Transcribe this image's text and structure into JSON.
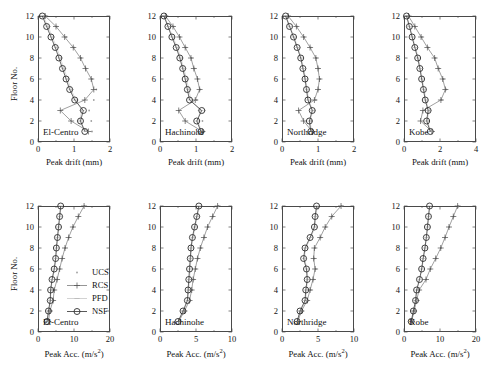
{
  "figure": {
    "ylabel": "Floor No.",
    "series_names": [
      "UCS",
      "RCS",
      "PFD",
      "NSF"
    ],
    "legend": [
      {
        "label": "UCS",
        "marker": "dot-small",
        "color": "#9a9a9a"
      },
      {
        "label": "RCS",
        "marker": "plus",
        "color": "#555555"
      },
      {
        "label": "PFD",
        "marker": "dash",
        "color": "#b0b0b0"
      },
      {
        "label": "NSF",
        "marker": "circle-line",
        "color": "#333333"
      }
    ]
  },
  "chart_data": [
    {
      "type": "line",
      "title": "El-Centro",
      "panel_tag": "El-Centro",
      "xlabel": "Peak drift (mm)",
      "ylabel": "Floor No.",
      "xlim": [
        0,
        2
      ],
      "ylim": [
        0,
        12
      ],
      "xticks": [
        0,
        1,
        2
      ],
      "yticks": [
        0,
        2,
        4,
        6,
        8,
        10,
        12
      ],
      "x_minor": [
        0.5,
        1.5
      ],
      "grid": false,
      "floors": [
        1,
        2,
        3,
        4,
        5,
        6,
        7,
        8,
        9,
        10,
        11,
        12
      ],
      "series": [
        {
          "name": "UCS",
          "values": [
            1.5,
            1.48,
            1.42,
            1.55,
            1.62,
            1.5,
            1.33,
            1.2,
            1.0,
            0.78,
            0.52,
            0.22
          ]
        },
        {
          "name": "RCS",
          "values": [
            1.4,
            0.92,
            0.62,
            1.3,
            1.55,
            1.48,
            1.32,
            1.18,
            0.98,
            0.74,
            0.5,
            0.2
          ]
        },
        {
          "name": "PFD",
          "values": [
            1.34,
            1.15,
            1.22,
            1.05,
            0.92,
            0.82,
            0.72,
            0.62,
            0.52,
            0.4,
            0.28,
            0.14
          ]
        },
        {
          "name": "NSF",
          "values": [
            1.3,
            1.18,
            1.26,
            1.02,
            0.88,
            0.78,
            0.68,
            0.58,
            0.48,
            0.36,
            0.24,
            0.12
          ]
        }
      ]
    },
    {
      "type": "line",
      "title": "Hachinohe",
      "panel_tag": "Hachinohe",
      "xlabel": "Peak drift (mm)",
      "ylabel": "Floor No.",
      "xlim": [
        0,
        2
      ],
      "ylim": [
        0,
        12
      ],
      "xticks": [
        0,
        1,
        2
      ],
      "yticks": [
        0,
        2,
        4,
        6,
        8,
        10,
        12
      ],
      "x_minor": [
        0.5,
        1.5
      ],
      "grid": false,
      "floors": [
        1,
        2,
        3,
        4,
        5,
        6,
        7,
        8,
        9,
        10,
        11,
        12
      ],
      "series": [
        {
          "name": "UCS",
          "values": [
            1.22,
            1.18,
            1.24,
            1.02,
            1.12,
            1.05,
            0.96,
            0.88,
            0.72,
            0.56,
            0.38,
            0.16
          ]
        },
        {
          "name": "RCS",
          "values": [
            1.18,
            0.7,
            0.52,
            0.98,
            1.1,
            1.04,
            0.94,
            0.86,
            0.7,
            0.54,
            0.36,
            0.15
          ]
        },
        {
          "name": "PFD",
          "values": [
            1.16,
            1.05,
            1.12,
            0.86,
            0.8,
            0.74,
            0.66,
            0.58,
            0.48,
            0.36,
            0.24,
            0.12
          ]
        },
        {
          "name": "NSF",
          "values": [
            1.14,
            1.02,
            1.16,
            0.82,
            0.76,
            0.7,
            0.63,
            0.55,
            0.45,
            0.33,
            0.22,
            0.11
          ]
        }
      ]
    },
    {
      "type": "line",
      "title": "Northridge",
      "panel_tag": "Northridge",
      "xlabel": "Peak drift (mm)",
      "ylabel": "Floor No.",
      "xlim": [
        0,
        2
      ],
      "ylim": [
        0,
        12
      ],
      "xticks": [
        0,
        1,
        2
      ],
      "yticks": [
        0,
        2,
        4,
        6,
        8,
        10,
        12
      ],
      "x_minor": [
        0.5,
        1.5
      ],
      "grid": false,
      "floors": [
        1,
        2,
        3,
        4,
        5,
        6,
        7,
        8,
        9,
        10,
        11,
        12
      ],
      "series": [
        {
          "name": "UCS",
          "values": [
            0.86,
            0.82,
            0.9,
            0.94,
            1.02,
            1.06,
            1.02,
            0.96,
            0.8,
            0.62,
            0.42,
            0.18
          ]
        },
        {
          "name": "RCS",
          "values": [
            0.84,
            0.6,
            0.46,
            0.9,
            1.0,
            1.04,
            1.0,
            0.94,
            0.78,
            0.6,
            0.4,
            0.17
          ]
        },
        {
          "name": "PFD",
          "values": [
            0.82,
            0.78,
            0.86,
            0.74,
            0.7,
            0.66,
            0.6,
            0.54,
            0.44,
            0.34,
            0.22,
            0.11
          ]
        },
        {
          "name": "NSF",
          "values": [
            0.8,
            0.76,
            0.84,
            0.72,
            0.68,
            0.64,
            0.58,
            0.52,
            0.42,
            0.32,
            0.21,
            0.1
          ]
        }
      ]
    },
    {
      "type": "line",
      "title": "Kobe",
      "panel_tag": "Kobe",
      "xlabel": "Peak drift (mm)",
      "ylabel": "Floor No.",
      "xlim": [
        0,
        4
      ],
      "ylim": [
        0,
        12
      ],
      "xticks": [
        0,
        2,
        4
      ],
      "yticks": [
        0,
        2,
        4,
        6,
        8,
        10,
        12
      ],
      "x_minor": [
        1,
        3
      ],
      "grid": false,
      "floors": [
        1,
        2,
        3,
        4,
        5,
        6,
        7,
        8,
        9,
        10,
        11,
        12
      ],
      "series": [
        {
          "name": "UCS",
          "values": [
            1.6,
            1.4,
            1.42,
            2.1,
            2.35,
            2.2,
            1.95,
            1.75,
            1.35,
            1.0,
            0.62,
            0.26
          ]
        },
        {
          "name": "RCS",
          "values": [
            1.55,
            0.92,
            1.05,
            2.05,
            2.3,
            2.15,
            1.9,
            1.7,
            1.3,
            0.95,
            0.6,
            0.25
          ]
        },
        {
          "name": "PFD",
          "values": [
            1.5,
            1.3,
            1.38,
            1.22,
            1.12,
            1.02,
            0.92,
            0.8,
            0.64,
            0.48,
            0.32,
            0.16
          ]
        },
        {
          "name": "NSF",
          "values": [
            1.46,
            1.26,
            1.34,
            1.18,
            1.08,
            0.98,
            0.88,
            0.76,
            0.6,
            0.45,
            0.3,
            0.14
          ]
        }
      ]
    },
    {
      "type": "line",
      "title": "El-Centro",
      "panel_tag": "El-Centro",
      "xlabel": "Peak Acc. (m/s²)",
      "ylabel": "Floor No.",
      "xlim": [
        0,
        20
      ],
      "ylim": [
        0,
        12
      ],
      "xticks": [
        0,
        10,
        20
      ],
      "yticks": [
        0,
        2,
        4,
        6,
        8,
        10,
        12
      ],
      "x_minor": [
        5,
        15
      ],
      "grid": false,
      "floors": [
        1,
        2,
        3,
        4,
        5,
        6,
        7,
        8,
        9,
        10,
        11,
        12
      ],
      "series": [
        {
          "name": "UCS",
          "values": [
            3.0,
            3.4,
            4.3,
            4.6,
            5.4,
            6.1,
            6.8,
            7.6,
            8.6,
            9.8,
            11.3,
            12.9
          ]
        },
        {
          "name": "RCS",
          "values": [
            2.9,
            3.3,
            4.2,
            4.5,
            5.3,
            6.0,
            6.7,
            7.5,
            8.5,
            9.7,
            11.2,
            12.8
          ]
        },
        {
          "name": "PFD",
          "values": [
            2.6,
            3.0,
            3.5,
            3.6,
            4.0,
            4.6,
            5.0,
            5.2,
            5.5,
            5.8,
            6.1,
            6.4
          ]
        },
        {
          "name": "NSF",
          "values": [
            2.5,
            2.9,
            3.4,
            3.5,
            3.9,
            4.5,
            4.9,
            5.1,
            5.4,
            5.7,
            6.0,
            6.3
          ]
        }
      ]
    },
    {
      "type": "line",
      "title": "Hachinohe",
      "panel_tag": "Hachinohe",
      "xlabel": "Peak Acc. (m/s²)",
      "ylabel": "Floor No.",
      "xlim": [
        0,
        10
      ],
      "ylim": [
        0,
        12
      ],
      "xticks": [
        0,
        5,
        10
      ],
      "yticks": [
        0,
        2,
        4,
        6,
        8,
        10,
        12
      ],
      "x_minor": [
        2.5,
        7.5
      ],
      "grid": false,
      "floors": [
        1,
        2,
        3,
        4,
        5,
        6,
        7,
        8,
        9,
        10,
        11,
        12
      ],
      "series": [
        {
          "name": "UCS",
          "values": [
            2.7,
            3.5,
            4.2,
            4.5,
            4.7,
            5.0,
            5.3,
            5.7,
            6.2,
            6.7,
            7.4,
            8.1
          ]
        },
        {
          "name": "RCS",
          "values": [
            2.6,
            3.4,
            4.1,
            4.4,
            4.6,
            4.9,
            5.2,
            5.6,
            6.1,
            6.6,
            7.3,
            8.0
          ]
        },
        {
          "name": "PFD",
          "values": [
            2.6,
            3.3,
            3.9,
            4.0,
            4.1,
            4.2,
            4.3,
            4.4,
            4.6,
            4.9,
            5.2,
            5.5
          ]
        },
        {
          "name": "NSF",
          "values": [
            2.5,
            3.2,
            3.8,
            3.9,
            4.0,
            4.1,
            4.2,
            4.3,
            4.5,
            4.8,
            5.1,
            5.4
          ]
        }
      ]
    },
    {
      "type": "line",
      "title": "Northridge",
      "panel_tag": "Northridge",
      "xlabel": "Peak Acc. (m/s²)",
      "ylabel": "Floor No.",
      "xlim": [
        0,
        10
      ],
      "ylim": [
        0,
        12
      ],
      "xticks": [
        0,
        5,
        10
      ],
      "yticks": [
        0,
        2,
        4,
        6,
        8,
        10,
        12
      ],
      "x_minor": [
        2.5,
        7.5
      ],
      "grid": false,
      "floors": [
        1,
        2,
        3,
        4,
        5,
        6,
        7,
        8,
        9,
        10,
        11,
        12
      ],
      "series": [
        {
          "name": "UCS",
          "values": [
            2.3,
            2.8,
            3.6,
            4.0,
            4.4,
            4.7,
            4.5,
            4.6,
            5.4,
            6.1,
            7.0,
            8.3
          ]
        },
        {
          "name": "RCS",
          "values": [
            2.2,
            2.7,
            3.5,
            3.9,
            4.3,
            4.6,
            4.4,
            4.5,
            5.3,
            6.0,
            6.9,
            8.2
          ]
        },
        {
          "name": "PFD",
          "values": [
            2.2,
            2.6,
            3.3,
            3.4,
            3.6,
            3.5,
            3.1,
            3.3,
            4.0,
            4.6,
            4.7,
            4.9
          ]
        },
        {
          "name": "NSF",
          "values": [
            2.1,
            2.5,
            3.2,
            3.3,
            3.5,
            3.4,
            3.0,
            3.2,
            3.9,
            4.5,
            4.6,
            4.8
          ]
        }
      ]
    },
    {
      "type": "line",
      "title": "Kobe",
      "panel_tag": "Kobe",
      "xlabel": "Peak Acc. (m/s²)",
      "ylabel": "Floor No.",
      "xlim": [
        0,
        20
      ],
      "ylim": [
        0,
        12
      ],
      "xticks": [
        0,
        10,
        20
      ],
      "yticks": [
        0,
        2,
        4,
        6,
        8,
        10,
        12
      ],
      "x_minor": [
        5,
        15
      ],
      "grid": false,
      "floors": [
        1,
        2,
        3,
        4,
        5,
        6,
        7,
        8,
        9,
        10,
        11,
        12
      ],
      "series": [
        {
          "name": "UCS",
          "values": [
            2.2,
            2.9,
            3.6,
            4.3,
            6.2,
            7.4,
            8.9,
            10.3,
            11.5,
            12.6,
            13.8,
            15.0
          ]
        },
        {
          "name": "RCS",
          "values": [
            2.1,
            2.8,
            3.5,
            4.2,
            6.1,
            7.3,
            8.8,
            10.2,
            11.4,
            12.5,
            13.7,
            14.9
          ]
        },
        {
          "name": "PFD",
          "values": [
            2.1,
            2.7,
            3.3,
            3.6,
            4.4,
            5.0,
            5.4,
            5.9,
            6.3,
            6.6,
            6.9,
            7.2
          ]
        },
        {
          "name": "NSF",
          "values": [
            2.0,
            2.6,
            3.2,
            3.5,
            4.3,
            4.9,
            5.3,
            5.8,
            6.2,
            6.5,
            6.8,
            7.1
          ]
        }
      ]
    }
  ]
}
